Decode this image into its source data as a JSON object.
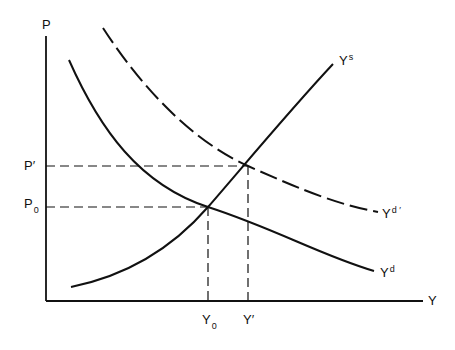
{
  "diagram": {
    "type": "supply-demand",
    "axes": {
      "y_label": "P",
      "x_label": "Y"
    },
    "curves": [
      {
        "id": "Ys",
        "label": "Y",
        "sup": "s",
        "style": "solid"
      },
      {
        "id": "Yd",
        "label": "Y",
        "sup": "d",
        "style": "solid"
      },
      {
        "id": "Yd_prime",
        "label": "Y",
        "sup": "d ′",
        "style": "dashed"
      }
    ],
    "price_labels": [
      {
        "id": "P_prime",
        "label": "P",
        "mark": "′"
      },
      {
        "id": "P0",
        "label": "P",
        "sub": "0"
      }
    ],
    "quantity_labels": [
      {
        "id": "Y0",
        "label": "Y",
        "sub": "0"
      },
      {
        "id": "Y_prime",
        "label": "Y",
        "mark": "′"
      }
    ],
    "colors": {
      "line": "#111111",
      "background": "#ffffff"
    }
  }
}
